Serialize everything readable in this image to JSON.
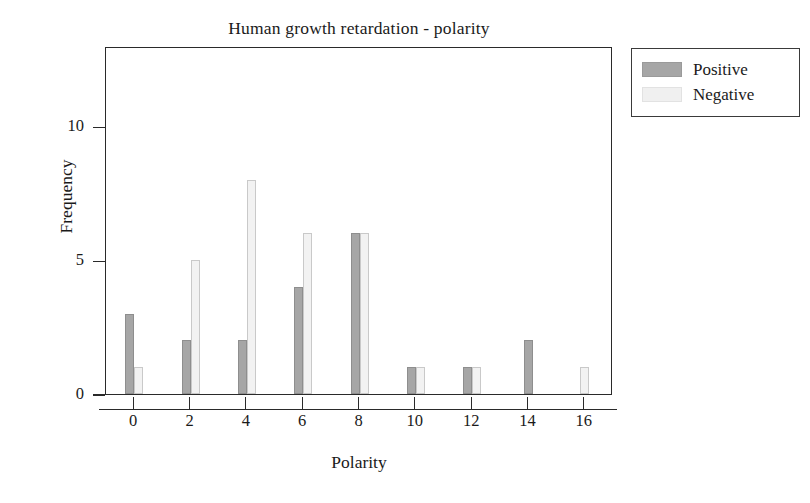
{
  "chart_data": {
    "type": "bar",
    "title": "Human growth retardation - polarity",
    "xlabel": "Polarity",
    "ylabel": "Frequency",
    "categories": [
      "0",
      "2",
      "4",
      "6",
      "8",
      "10",
      "12",
      "14",
      "16"
    ],
    "series": [
      {
        "name": "Positive",
        "color": "#a6a6a6",
        "values": [
          3,
          2,
          2,
          4,
          6,
          1,
          1,
          2,
          0
        ]
      },
      {
        "name": "Negative",
        "color": "#f0f0f0",
        "values": [
          1,
          5,
          8,
          6,
          6,
          1,
          1,
          0,
          1
        ]
      }
    ],
    "xlim": [
      -1,
      17
    ],
    "ylim": [
      0,
      13
    ],
    "yticks": [
      0,
      5,
      10
    ],
    "xticks": [
      0,
      2,
      4,
      6,
      8,
      10,
      12,
      14,
      16
    ],
    "grid": false,
    "legend_position": "right-outside"
  },
  "legend": {
    "entries": [
      {
        "label": "Positive",
        "swatch": "positive-swatch"
      },
      {
        "label": "Negative",
        "swatch": "negative-swatch"
      }
    ]
  }
}
